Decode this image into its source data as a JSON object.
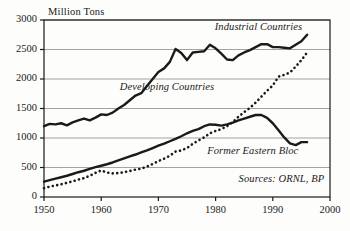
{
  "chart_data": {
    "type": "line",
    "title": "",
    "subtitle": "",
    "xlabel": "",
    "ylabel": "Million Tons",
    "xlim": [
      1950,
      2000
    ],
    "ylim": [
      0,
      3000
    ],
    "grid": true,
    "legend_position": "inline-annotations",
    "xticks": [
      "1950",
      "1960",
      "1970",
      "1980",
      "1990",
      "2000"
    ],
    "xtick_values": [
      1950,
      1960,
      1970,
      1980,
      1990,
      2000
    ],
    "yticks": [
      "0",
      "500",
      "1000",
      "1500",
      "2000",
      "2500",
      "3000"
    ],
    "ytick_values": [
      0,
      500,
      1000,
      1500,
      2000,
      2500,
      3000
    ],
    "annotations": [
      {
        "text": "Industrial Countries",
        "x": 1987.5,
        "y": 2870,
        "style": "italic"
      },
      {
        "text": "Developing Countries",
        "x": 1971.5,
        "y": 1840,
        "style": "italic"
      },
      {
        "text": "Former Eastern Bloc",
        "x": 1986.5,
        "y": 760,
        "style": "italic"
      },
      {
        "text": "Sources: ORNL, BP",
        "x": 1991.5,
        "y": 290,
        "style": "italic"
      }
    ],
    "x": [
      1950,
      1951,
      1952,
      1953,
      1954,
      1955,
      1956,
      1957,
      1958,
      1959,
      1960,
      1961,
      1962,
      1963,
      1964,
      1965,
      1966,
      1967,
      1968,
      1969,
      1970,
      1971,
      1972,
      1973,
      1974,
      1975,
      1976,
      1977,
      1978,
      1979,
      1980,
      1981,
      1982,
      1983,
      1984,
      1985,
      1986,
      1987,
      1988,
      1989,
      1990,
      1991,
      1992,
      1993,
      1994,
      1995,
      1996
    ],
    "series": [
      {
        "name": "Industrial Countries",
        "style": "solid",
        "color": "#1a1a1a",
        "width": 2.4,
        "values": [
          1200,
          1240,
          1230,
          1250,
          1215,
          1265,
          1300,
          1330,
          1300,
          1345,
          1400,
          1390,
          1430,
          1500,
          1560,
          1640,
          1720,
          1760,
          1880,
          2000,
          2120,
          2180,
          2290,
          2510,
          2440,
          2320,
          2450,
          2460,
          2470,
          2580,
          2520,
          2430,
          2330,
          2320,
          2400,
          2450,
          2490,
          2540,
          2590,
          2590,
          2540,
          2540,
          2530,
          2520,
          2580,
          2640,
          2750
        ]
      },
      {
        "name": "Developing Countries",
        "style": "dotted",
        "color": "#1a1a1a",
        "width": 2.6,
        "values": [
          150,
          175,
          195,
          215,
          240,
          265,
          295,
          320,
          360,
          410,
          450,
          415,
          400,
          405,
          420,
          440,
          465,
          480,
          515,
          560,
          610,
          650,
          700,
          770,
          790,
          830,
          900,
          960,
          1010,
          1080,
          1120,
          1150,
          1200,
          1270,
          1360,
          1440,
          1510,
          1600,
          1700,
          1800,
          1890,
          2040,
          2070,
          2110,
          2210,
          2320,
          2450
        ]
      },
      {
        "name": "Former Eastern Bloc",
        "style": "solid",
        "color": "#1a1a1a",
        "width": 2.4,
        "values": [
          260,
          285,
          310,
          335,
          360,
          390,
          420,
          445,
          475,
          505,
          530,
          555,
          585,
          620,
          655,
          690,
          720,
          755,
          790,
          830,
          870,
          905,
          945,
          985,
          1030,
          1080,
          1120,
          1150,
          1200,
          1230,
          1225,
          1210,
          1230,
          1260,
          1300,
          1330,
          1360,
          1390,
          1390,
          1340,
          1250,
          1130,
          1010,
          910,
          880,
          930,
          930
        ]
      }
    ]
  }
}
